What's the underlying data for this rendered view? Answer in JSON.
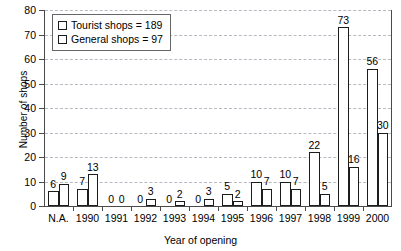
{
  "chart_data": {
    "type": "bar",
    "title": "",
    "xlabel": "Year of opening",
    "ylabel": "Number of shops",
    "ylim": [
      0,
      80
    ],
    "yticks": [
      0,
      10,
      20,
      30,
      40,
      50,
      60,
      70,
      80
    ],
    "grid": true,
    "legend_position": "top-left",
    "categories": [
      "N.A.",
      "1990",
      "1991",
      "1992",
      "1993",
      "1994",
      "1995",
      "1996",
      "1997",
      "1998",
      "1999",
      "2000"
    ],
    "series": [
      {
        "name": "Tourist shops = 189",
        "short_name": "Tourist shops",
        "total": 189,
        "pattern": "dotted",
        "values": [
          6,
          7,
          0,
          0,
          0,
          0,
          5,
          10,
          10,
          22,
          73,
          56
        ]
      },
      {
        "name": "General shops = 97",
        "short_name": "General shops",
        "total": 97,
        "pattern": "empty",
        "values": [
          9,
          13,
          0,
          3,
          2,
          3,
          2,
          7,
          7,
          5,
          16,
          30
        ]
      }
    ]
  },
  "colors": {
    "axis": "#4a4a4a",
    "bar_outline": "#1c1c1c",
    "gridline": "#b9b9c4",
    "background": "#ffffff",
    "text": "#000000"
  }
}
